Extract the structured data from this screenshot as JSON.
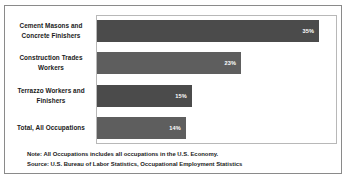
{
  "chart_data": {
    "type": "bar",
    "orientation": "horizontal",
    "title": "",
    "xlabel": "",
    "ylabel": "",
    "xlim": [
      0,
      40
    ],
    "grid": false,
    "legend": null,
    "categories": [
      "Cement Masons and Concrete Finishers",
      "Construction Trades Workers",
      "Terrazzo Workers and Finishers",
      "Total, All Occupations"
    ],
    "values": [
      35,
      23,
      15,
      14
    ],
    "value_labels": [
      "35%",
      "23%",
      "15%",
      "14%"
    ],
    "bar_colors": [
      "#4b4b4b",
      "#5e5e5e",
      "#4b4b4b",
      "#5e5e5e"
    ]
  },
  "bars": [
    {
      "label_line1": "Cement Masons and",
      "label_line2": "Concrete Finishers",
      "value_label": "35%",
      "value": 35,
      "color": "#4b4b4b",
      "width_pct": "92.5%"
    },
    {
      "label_line1": "Construction Trades",
      "label_line2": "Workers",
      "value_label": "23%",
      "value": 23,
      "color": "#5e5e5e",
      "width_pct": "60.0%"
    },
    {
      "label_line1": "Terrazzo Workers and",
      "label_line2": "Finishers",
      "value_label": "15%",
      "value": 15,
      "color": "#4b4b4b",
      "width_pct": "39.5%"
    },
    {
      "label_line1": "Total, All Occupations",
      "label_line2": "",
      "value_label": "14%",
      "value": 14,
      "color": "#5e5e5e",
      "width_pct": "37.0%"
    }
  ],
  "notes": {
    "note": "Note: All Occupations includes all occupations in the U.S. Economy.",
    "source": "Source: U.S. Bureau of Labor Statistics, Occupational Employment Statistics"
  }
}
